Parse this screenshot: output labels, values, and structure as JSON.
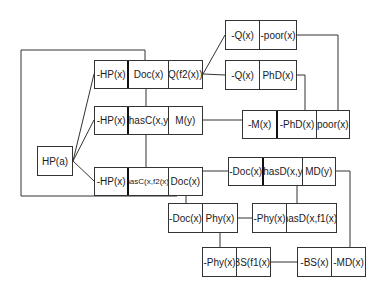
{
  "diagram": {
    "type": "resolution-refutation-tree",
    "root": {
      "id": "root",
      "literals": [
        "HP(a)"
      ]
    },
    "clauses": [
      {
        "id": "c1",
        "literals": [
          "-HP(x)",
          "Doc(x)",
          "Q(f2(x))"
        ]
      },
      {
        "id": "c2",
        "literals": [
          "-HP(x)",
          "-hasC(x,y)",
          "M(y)"
        ]
      },
      {
        "id": "c3",
        "literals": [
          "-HP(x)",
          "hasC(x,f2(x))",
          "Doc(x)"
        ]
      },
      {
        "id": "c4",
        "literals": [
          "-Q(x)",
          "-poor(x)"
        ]
      },
      {
        "id": "c5",
        "literals": [
          "-Q(x)",
          "PhD(x)"
        ]
      },
      {
        "id": "c6",
        "literals": [
          "-M(x)",
          "-PhD(x)",
          "poor(x)"
        ]
      },
      {
        "id": "c7",
        "literals": [
          "-Doc(x)",
          "-hasD(x,y)",
          "MD(y)"
        ]
      },
      {
        "id": "c8",
        "literals": [
          "-Doc(x)",
          "Phy(x)"
        ]
      },
      {
        "id": "c9",
        "literals": [
          "-Phy(x)",
          "hasD(x,f1(x))"
        ]
      },
      {
        "id": "c10",
        "literals": [
          "-Phy(x)",
          "BS(f1(x))"
        ]
      },
      {
        "id": "c11",
        "literals": [
          "-BS(x)",
          "-MD(x)"
        ]
      }
    ],
    "edges": [
      [
        "root",
        "c1"
      ],
      [
        "root",
        "c2"
      ],
      [
        "root",
        "c3"
      ],
      [
        "c1",
        "c4"
      ],
      [
        "c1",
        "c5"
      ],
      [
        "c1",
        "c2"
      ],
      [
        "c2",
        "c3"
      ],
      [
        "c1",
        "c3"
      ],
      [
        "c2",
        "c6"
      ],
      [
        "c4",
        "c6"
      ],
      [
        "c5",
        "c6"
      ],
      [
        "c3",
        "c7"
      ],
      [
        "c3",
        "c8"
      ],
      [
        "c8",
        "c9"
      ],
      [
        "c7",
        "c9"
      ],
      [
        "c8",
        "c10"
      ],
      [
        "c10",
        "c11"
      ],
      [
        "c7",
        "c11"
      ]
    ]
  }
}
